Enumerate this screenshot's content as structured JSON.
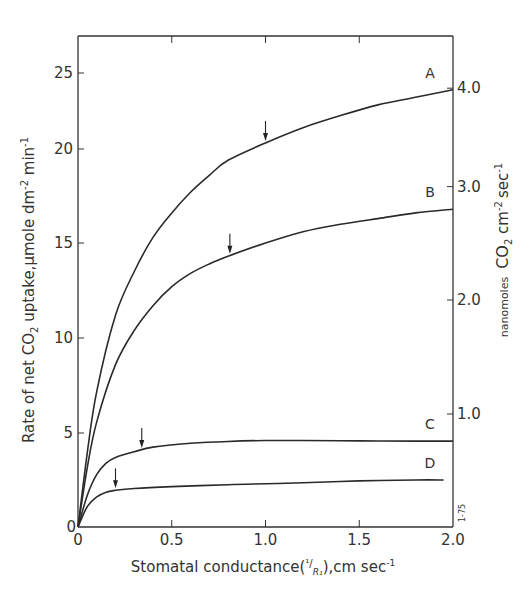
{
  "chart_data": {
    "type": "line",
    "title": "",
    "xlabel": "Stomatal conductance(¹/R₁),cm sec⁻¹",
    "xlabel_parts": {
      "pre": "Stomatal conductance(",
      "frac": "¹/",
      "sub": "R₁",
      "post": "),cm sec",
      "sup": "-1"
    },
    "ylabel": "Rate of net CO₂ uptake,μmole dm⁻² min⁻¹",
    "ylabel_parts": {
      "pre": "Rate of net CO",
      "sub": "2",
      "mid": " uptake,μmole dm",
      "sup1": "-2",
      "mid2": " min",
      "sup2": "-1"
    },
    "y2label": "nanomoles CO₂ cm⁻² sec⁻¹",
    "y2label_parts": {
      "small": "nanomoles",
      "co": "CO",
      "sub": "2",
      "cm": " cm",
      "sup1": "-2",
      "sec": "sec",
      "sup2": "-1"
    },
    "xlim": [
      0,
      2.0
    ],
    "ylim": [
      0,
      27
    ],
    "y2lim": [
      0,
      4.5
    ],
    "xticks": [
      "0",
      "0.5",
      "1.0",
      "1.5",
      "2.0"
    ],
    "xtick_values": [
      0,
      0.5,
      1.0,
      1.5,
      2.0
    ],
    "yticks": [
      "0",
      "5",
      "10",
      "15",
      "20",
      "25"
    ],
    "ytick_values": [
      0,
      5,
      10,
      15,
      20,
      25
    ],
    "y2ticks": [
      "1.0",
      "2.0",
      "3.0",
      "4.0"
    ],
    "y2tick_values": [
      1.0,
      2.0,
      3.0,
      4.0
    ],
    "grid": false,
    "legend": "inline curve labels at right end",
    "stamp": "1-75",
    "series": [
      {
        "name": "A",
        "x": [
          0,
          0.05,
          0.1,
          0.2,
          0.3,
          0.4,
          0.5,
          0.6,
          0.7,
          0.8,
          1.0,
          1.2,
          1.4,
          1.6,
          1.8,
          2.0
        ],
        "y": [
          0,
          4.0,
          7.2,
          11.2,
          13.5,
          15.3,
          16.6,
          17.7,
          18.6,
          19.4,
          20.4,
          21.4,
          22.2,
          22.9,
          23.4,
          23.9
        ],
        "arrow_x": 1.0
      },
      {
        "name": "B",
        "x": [
          0,
          0.05,
          0.1,
          0.2,
          0.3,
          0.4,
          0.5,
          0.6,
          0.7,
          0.8,
          1.0,
          1.2,
          1.4,
          1.6,
          1.8,
          2.0
        ],
        "y": [
          0,
          3.2,
          5.6,
          8.6,
          10.4,
          11.7,
          12.7,
          13.4,
          13.9,
          14.3,
          15.0,
          15.6,
          16.0,
          16.3,
          16.6,
          16.8
        ],
        "arrow_x": 0.81
      },
      {
        "name": "C",
        "x": [
          0,
          0.05,
          0.1,
          0.15,
          0.2,
          0.3,
          0.4,
          0.6,
          0.8,
          1.0,
          1.2,
          1.5,
          1.8,
          2.0
        ],
        "y": [
          0,
          1.7,
          2.8,
          3.4,
          3.7,
          4.0,
          4.25,
          4.45,
          4.55,
          4.6,
          4.6,
          4.58,
          4.57,
          4.57
        ],
        "arrow_x": 0.34
      },
      {
        "name": "D",
        "x": [
          0,
          0.05,
          0.1,
          0.15,
          0.2,
          0.3,
          0.5,
          0.8,
          1.0,
          1.2,
          1.5,
          1.8,
          1.95
        ],
        "y": [
          0,
          1.1,
          1.6,
          1.85,
          1.95,
          2.05,
          2.15,
          2.25,
          2.3,
          2.35,
          2.45,
          2.5,
          2.5
        ],
        "arrow_x": 0.2
      }
    ]
  }
}
